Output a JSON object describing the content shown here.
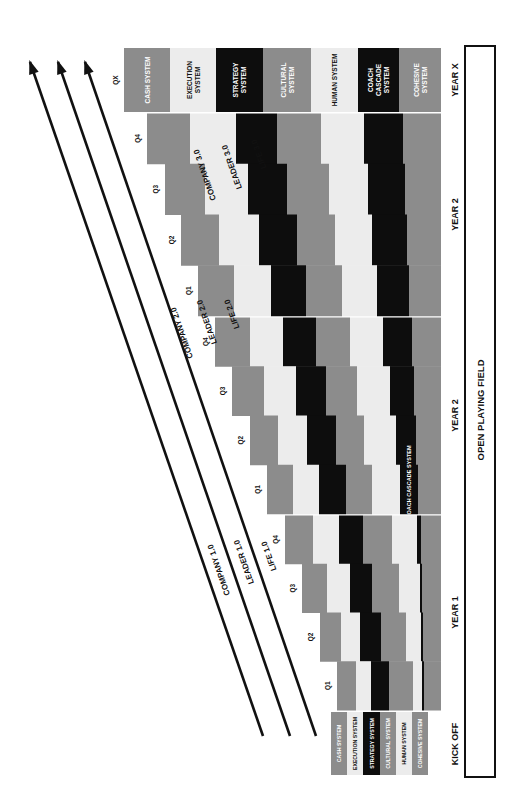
{
  "colors": {
    "gray": "#8c8c8c",
    "light": "#ececec",
    "black": "#0d0d0d",
    "text_dark": "#111111",
    "text_light": "#ffffff",
    "line": "#111111"
  },
  "systems": [
    {
      "key": "cash",
      "label": "CASH SYSTEM",
      "color": "gray"
    },
    {
      "key": "execution",
      "label": "EXECUTION SYSTEM",
      "color": "light"
    },
    {
      "key": "strategy",
      "label": "STRATEGY SYSTEM",
      "color": "black"
    },
    {
      "key": "cultural",
      "label": "CULTURAL SYSTEM",
      "color": "gray"
    },
    {
      "key": "human",
      "label": "HUMAN SYSTEM",
      "color": "light"
    },
    {
      "key": "coach",
      "label": "COACH CASCADE SYSTEM",
      "color": "black"
    },
    {
      "key": "cohesive",
      "label": "COHESIVE SYSTEM",
      "color": "gray"
    }
  ],
  "year_x": {
    "label": "YEAR X",
    "quarter": "QX",
    "y": [
      48,
      112
    ],
    "bands": [
      {
        "x": [
          124,
          170
        ],
        "lines": [
          "CASH SYSTEM"
        ]
      },
      {
        "x": [
          170,
          216
        ],
        "lines": [
          "EXECUTION",
          "SYSTEM"
        ]
      },
      {
        "x": [
          216,
          263
        ],
        "lines": [
          "STRATEGY",
          "SYSTEM"
        ]
      },
      {
        "x": [
          263,
          311
        ],
        "lines": [
          "CULTURAL",
          "SYSTEM"
        ]
      },
      {
        "x": [
          311,
          358
        ],
        "lines": [
          "HUMAN SYSTEM"
        ]
      },
      {
        "x": [
          358,
          399
        ],
        "lines": [
          "COACH",
          "CASCADE",
          "SYSTEM"
        ]
      },
      {
        "x": [
          399,
          441
        ],
        "lines": [
          "COHESIVE",
          "SYSTEM"
        ]
      }
    ]
  },
  "years": [
    {
      "label": "YEAR 2",
      "y": [
        113,
        316
      ],
      "quarters": [
        "Q4",
        "Q3",
        "Q2",
        "Q1"
      ],
      "rows": [
        {
          "starts": [
            147,
            190,
            236,
            277,
            321,
            364,
            403
          ]
        },
        {
          "starts": [
            165,
            205,
            248,
            287,
            329,
            368,
            405
          ]
        },
        {
          "starts": [
            181,
            219,
            259,
            297,
            335,
            372,
            407
          ]
        },
        {
          "starts": [
            198,
            234,
            271,
            306,
            342,
            377,
            409
          ]
        }
      ],
      "band_label": null
    },
    {
      "label": "YEAR 2",
      "y": [
        317,
        514
      ],
      "quarters": [
        "Q4",
        "Q3",
        "Q2",
        "Q1"
      ],
      "rows": [
        {
          "starts": [
            215,
            250,
            283,
            316,
            350,
            383,
            412
          ]
        },
        {
          "starts": [
            232,
            264,
            296,
            326,
            357,
            390,
            414
          ]
        },
        {
          "starts": [
            250,
            278,
            307,
            336,
            364,
            396,
            416
          ]
        },
        {
          "starts": [
            267,
            293,
            319,
            346,
            372,
            400,
            418
          ]
        }
      ],
      "band_label": {
        "band": 5,
        "text": "COACH CASCADE SYSTEM"
      }
    },
    {
      "label": "YEAR 1",
      "y": [
        515,
        710
      ],
      "quarters": [
        "Q4",
        "Q3",
        "Q2",
        "Q1"
      ],
      "rows": [
        {
          "starts": [
            285,
            313,
            339,
            363,
            392,
            417,
            421
          ]
        },
        {
          "starts": [
            302,
            327,
            350,
            372,
            399,
            420,
            422
          ]
        },
        {
          "starts": [
            320,
            341,
            360,
            381,
            406,
            421,
            423
          ]
        },
        {
          "starts": [
            337,
            356,
            371,
            389,
            413,
            422,
            424
          ]
        }
      ],
      "band_label": null
    }
  ],
  "kickoff": {
    "label": "KICK OFF",
    "y": [
      712,
      775
    ],
    "bands": [
      {
        "x": [
          331,
          347
        ],
        "label": "CASH SYSTEM"
      },
      {
        "x": [
          347,
          363
        ],
        "label": "EXECUTION SYSTEM"
      },
      {
        "x": [
          363,
          380
        ],
        "label": "STRATEGY SYSTEM"
      },
      {
        "x": [
          380,
          396
        ],
        "label": "CULTURAL SYSTEM"
      },
      {
        "x": [
          396,
          412
        ],
        "label": "HUMAN SYSTEM"
      },
      {
        "x": [
          412,
          428
        ],
        "label": "COHESIVE SYSTEM"
      }
    ]
  },
  "field": {
    "label": "OPEN PLAYING FIELD",
    "box": {
      "x": 465,
      "y": 46,
      "w": 30,
      "h": 731
    }
  },
  "arrows": [
    {
      "label": "COMPANY 3.0",
      "tail": [
        263,
        736
      ],
      "head": [
        30,
        62
      ],
      "label_at": [
        205,
        175
      ]
    },
    {
      "label": "LEADER 3.0",
      "tail": [
        290,
        736
      ],
      "head": [
        58,
        62
      ],
      "label_at": [
        232,
        167
      ]
    },
    {
      "label": "LIFE 3.0",
      "tail": [
        316,
        736
      ],
      "head": [
        85,
        62
      ],
      "label_at": [
        259,
        154
      ]
    },
    {
      "label": "COMPANY 2.0",
      "label_at": [
        182,
        333
      ]
    },
    {
      "label": "LEADER 2.0",
      "label_at": [
        207,
        322
      ]
    },
    {
      "label": "LIFE 2.0",
      "label_at": [
        232,
        314
      ]
    },
    {
      "label": "COMPANY 1.0",
      "label_at": [
        219,
        570
      ]
    },
    {
      "label": "LEADER 1.0",
      "label_at": [
        244,
        562
      ]
    },
    {
      "label": "LIFE 1.0",
      "label_at": [
        269,
        556
      ]
    }
  ]
}
